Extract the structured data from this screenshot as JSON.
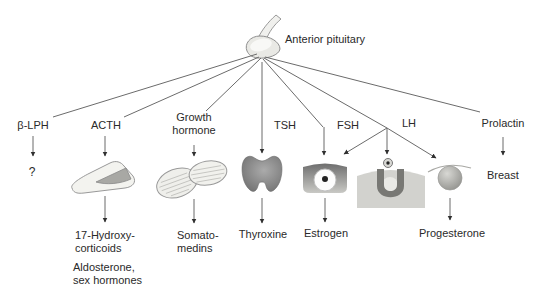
{
  "colors": {
    "background": "#ffffff",
    "line": "#6b6b6b",
    "arrowhead": "#2f2f2f",
    "text": "#2a2a2a",
    "organ_light": "#efefeb",
    "organ_mid": "#b0b0ac",
    "organ_dark": "#787874"
  },
  "diagram": {
    "title": "Anterior pituitary",
    "organs": {
      "pituitary": "anterior-pituitary-gland",
      "acth_target": "adrenal-gland",
      "growth_target": "bone-muscle-tissue",
      "tsh_target": "thyroid-gland",
      "fsh_target": "ovarian-follicle",
      "lh_target": "ovulation-corpus-luteum",
      "prolactin_target": "breast"
    },
    "hormones": {
      "beta_lph": {
        "label": "β-LPH",
        "product": "?"
      },
      "acth": {
        "label": "ACTH",
        "product": "17-Hydroxy-\ncorticoids",
        "product2": "Aldosterone,\nsex hormones"
      },
      "growth": {
        "label": "Growth\nhormone",
        "product": "Somato-\nmedins"
      },
      "tsh": {
        "label": "TSH",
        "product": "Thyroxine"
      },
      "fsh": {
        "label": "FSH",
        "product": "Estrogen"
      },
      "lh": {
        "label": "LH",
        "product": "Progesterone"
      },
      "prolactin": {
        "label": "Prolactin",
        "target_label": "Breast"
      }
    }
  }
}
